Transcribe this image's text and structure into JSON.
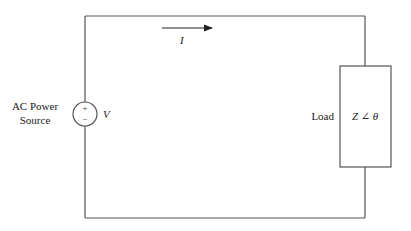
{
  "diagram": {
    "type": "ac-circuit",
    "source": {
      "label_line1": "AC Power",
      "label_line2": "Source",
      "symbol": "V",
      "plus": "+",
      "minus": "−"
    },
    "current": {
      "symbol": "I",
      "direction": "right"
    },
    "load": {
      "label": "Load",
      "impedance": "Z ∠ θ"
    },
    "colors": {
      "wire": "#555555",
      "text": "#222222",
      "background": "#ffffff"
    }
  }
}
